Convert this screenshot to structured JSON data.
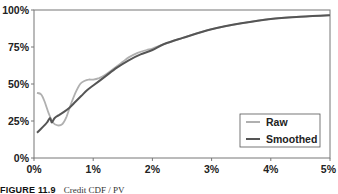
{
  "chart_data": {
    "type": "line",
    "title": "",
    "xlabel": "",
    "ylabel": "",
    "xlim": [
      0,
      5
    ],
    "ylim": [
      0,
      100
    ],
    "x_ticks": [
      "0%",
      "1%",
      "2%",
      "3%",
      "4%",
      "5%"
    ],
    "y_ticks": [
      "0%",
      "25%",
      "50%",
      "75%",
      "100%"
    ],
    "grid": false,
    "legend": {
      "placement": "bottom-right",
      "entries": [
        "Raw",
        "Smoothed"
      ]
    },
    "series": [
      {
        "name": "Raw",
        "color": "#b0b0b0",
        "x": [
          0.05,
          0.12,
          0.18,
          0.25,
          0.32,
          0.4,
          0.48,
          0.55,
          0.62,
          0.7,
          0.78,
          0.85,
          0.92,
          1.0,
          1.1,
          1.2,
          1.3,
          1.4,
          1.5,
          1.6,
          1.75,
          1.9,
          2.0,
          2.2,
          2.5,
          3.0,
          3.5,
          4.0,
          4.5,
          5.0
        ],
        "y": [
          44,
          43,
          38,
          30,
          24,
          22,
          23,
          28,
          36,
          44,
          50,
          52,
          53,
          53,
          54,
          56,
          59,
          62,
          65,
          68,
          71,
          73,
          74,
          77,
          81,
          87,
          91,
          94,
          95.5,
          96.5
        ]
      },
      {
        "name": "Smoothed",
        "color": "#555555",
        "x": [
          0.05,
          0.15,
          0.22,
          0.27,
          0.3,
          0.35,
          0.42,
          0.5,
          0.6,
          0.7,
          0.8,
          0.9,
          1.0,
          1.2,
          1.4,
          1.6,
          1.8,
          2.0,
          2.2,
          2.5,
          3.0,
          3.5,
          4.0,
          4.5,
          5.0
        ],
        "y": [
          17,
          21,
          24,
          27,
          24,
          27,
          29,
          31,
          34,
          38,
          42,
          46,
          49,
          55,
          61,
          66,
          70,
          73,
          77,
          81,
          87,
          91,
          94,
          95.5,
          96.5
        ]
      }
    ]
  },
  "caption": {
    "figure_label": "FIGURE 11.9",
    "text": "Credit CDF / PV"
  }
}
